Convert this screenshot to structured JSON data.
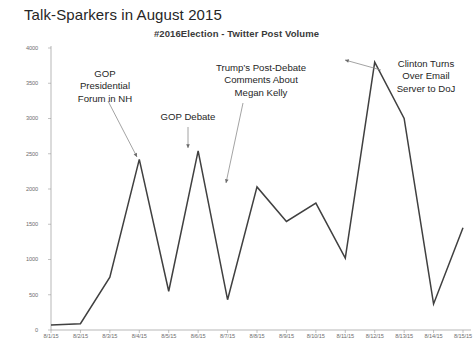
{
  "slide": {
    "title": "Talk-Sparkers in August 2015"
  },
  "chart_data": {
    "type": "line",
    "title": "#2016Election - Twitter Post Volume",
    "subtitle": "",
    "xlabel": "",
    "ylabel": "",
    "categories": [
      "8/1/15",
      "8/2/15",
      "8/3/15",
      "8/4/15",
      "8/5/15",
      "8/6/15",
      "8/7/15",
      "8/8/15",
      "8/9/15",
      "8/10/15",
      "8/11/15",
      "8/12/15",
      "8/13/15",
      "8/14/15",
      "8/15/15"
    ],
    "values": [
      70,
      90,
      750,
      2420,
      550,
      2540,
      430,
      2030,
      1540,
      1800,
      1020,
      3800,
      3000,
      370,
      1450
    ],
    "series": [
      {
        "name": "Twitter Post Volume",
        "values": [
          70,
          90,
          750,
          2420,
          550,
          2540,
          430,
          2030,
          1540,
          1800,
          1020,
          3800,
          3000,
          370,
          1450
        ]
      }
    ],
    "ylim": [
      0,
      4000
    ],
    "yticks": [
      0,
      500,
      1000,
      1500,
      2000,
      2500,
      3000,
      3500,
      4000
    ],
    "ytick_labels": [
      "0",
      "500",
      "1000",
      "1500",
      "2000",
      "2500",
      "3000",
      "3500",
      "4000"
    ],
    "grid": false,
    "legend": "none",
    "line_color": "#404040",
    "annotations": [
      {
        "id": "gop-forum",
        "text": "GOP\nPresidential\nForum in NH",
        "points_to": "8/4/15"
      },
      {
        "id": "gop-debate",
        "text": "GOP Debate",
        "points_to": "8/6/15"
      },
      {
        "id": "trump-megan-kelly",
        "text": "Trump’s Post-Debate\nComments About\nMegan Kelly",
        "points_to": "8/8/15"
      },
      {
        "id": "clinton-email",
        "text": "Clinton Turns\nOver Email\nServer to DoJ",
        "points_to": "8/12/15"
      }
    ]
  },
  "footer": {
    "text": ""
  }
}
